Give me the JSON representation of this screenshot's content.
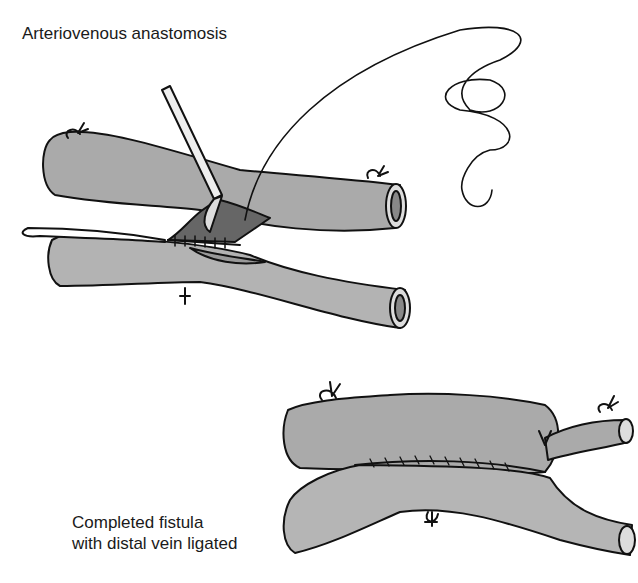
{
  "figure": {
    "title": "Arteriovenous anastomosis",
    "caption_line1": "Completed fistula",
    "caption_line2": "with distal vein ligated"
  },
  "colors": {
    "vessel_fill": "#a9a9a9",
    "vessel_fill_light": "#b8b8b8",
    "outline": "#111111",
    "background": "#ffffff"
  }
}
